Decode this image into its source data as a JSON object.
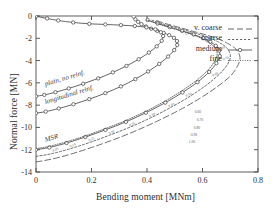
{
  "figure": {
    "background_color": "#ffffff",
    "line_color": "#4a4a4a",
    "text_color": "#2e2e2e"
  },
  "chart_data": {
    "type": "line",
    "title": "",
    "xlabel": "Bending moment [MNm]",
    "ylabel": "Normal force [MN]",
    "xlim": [
      0,
      0.8
    ],
    "ylim": [
      -14,
      0
    ],
    "xticks": [
      "0",
      "0.2",
      "0.4",
      "0.6",
      "0.8"
    ],
    "xtick_values": [
      0,
      0.2,
      0.4,
      0.6,
      0.8
    ],
    "yticks": [
      "-14",
      "-12",
      "-10",
      "-8",
      "-6",
      "-4",
      "-2",
      "0"
    ],
    "ytick_values": [
      -14,
      -12,
      -10,
      -8,
      -6,
      -4,
      -2,
      0
    ],
    "grid": false,
    "legend_position": "top-right",
    "legend": [
      {
        "label": "v. coarse",
        "style": "long-dashed"
      },
      {
        "label": "coarse",
        "style": "dashed"
      },
      {
        "label": "medium",
        "style": "solid-markers"
      },
      {
        "label": "fine",
        "style": "dotted"
      }
    ],
    "annotations": [
      {
        "text": "MSR",
        "x": 0.02,
        "y": -11.3
      },
      {
        "text": "longitudinal reinf.",
        "x": 0.02,
        "y": -7.9
      },
      {
        "text": "plain, no reinf.",
        "x": 0.02,
        "y": -6.3
      }
    ],
    "point_labels_msr": [
      "0.05",
      "0.10",
      "0.15",
      "0.20",
      "0.25",
      "0.30",
      "0.40",
      "0.50",
      "0.60",
      "0.70",
      "0.80",
      "0.90",
      "1.00"
    ],
    "series": [
      {
        "name": "MSR v. coarse",
        "group": "MSR",
        "mesh": "v. coarse",
        "style": "long-dashed",
        "x": [
          0.0,
          0.055,
          0.125,
          0.2,
          0.28,
          0.36,
          0.44,
          0.52,
          0.59,
          0.65,
          0.7,
          0.725,
          0.735,
          0.73,
          0.715,
          0.69,
          0.66,
          0.62,
          0.57,
          0.52,
          0.47,
          0.43
        ],
        "y": [
          -13.1,
          -12.85,
          -12.4,
          -11.8,
          -11.1,
          -10.3,
          -9.4,
          -8.4,
          -7.4,
          -6.4,
          -5.4,
          -4.55,
          -3.85,
          -3.3,
          -2.85,
          -2.45,
          -2.1,
          -1.75,
          -1.4,
          -1.05,
          -0.7,
          -0.38
        ]
      },
      {
        "name": "MSR coarse",
        "group": "MSR",
        "mesh": "coarse",
        "style": "dashed",
        "x": [
          0.0,
          0.052,
          0.118,
          0.19,
          0.265,
          0.342,
          0.418,
          0.492,
          0.558,
          0.614,
          0.66,
          0.688,
          0.7,
          0.697,
          0.684,
          0.662,
          0.634,
          0.598,
          0.552,
          0.504,
          0.456,
          0.418
        ],
        "y": [
          -12.6,
          -12.38,
          -11.95,
          -11.38,
          -10.7,
          -9.94,
          -9.08,
          -8.12,
          -7.16,
          -6.2,
          -5.24,
          -4.42,
          -3.74,
          -3.22,
          -2.78,
          -2.4,
          -2.06,
          -1.72,
          -1.38,
          -1.04,
          -0.7,
          -0.38
        ]
      },
      {
        "name": "MSR medium",
        "group": "MSR",
        "mesh": "medium",
        "style": "solid-markers",
        "x": [
          0.0,
          0.048,
          0.11,
          0.178,
          0.25,
          0.324,
          0.396,
          0.466,
          0.528,
          0.582,
          0.624,
          0.65,
          0.662,
          0.66,
          0.648,
          0.628,
          0.602,
          0.568,
          0.526,
          0.482,
          0.438,
          0.402
        ],
        "y": [
          -12.0,
          -11.8,
          -11.4,
          -10.86,
          -10.22,
          -9.5,
          -8.68,
          -7.78,
          -6.86,
          -5.94,
          -5.02,
          -4.24,
          -3.6,
          -3.1,
          -2.68,
          -2.32,
          -1.99,
          -1.66,
          -1.33,
          -1.0,
          -0.67,
          -0.36
        ]
      },
      {
        "name": "MSR fine",
        "group": "MSR",
        "mesh": "fine",
        "style": "dotted",
        "x": [
          0.0,
          0.047,
          0.108,
          0.175,
          0.246,
          0.319,
          0.39,
          0.459,
          0.52,
          0.573,
          0.615,
          0.64,
          0.652,
          0.65,
          0.638,
          0.619,
          0.593,
          0.56,
          0.519,
          0.476,
          0.433,
          0.398
        ],
        "y": [
          -11.9,
          -11.7,
          -11.3,
          -10.78,
          -10.14,
          -9.43,
          -8.62,
          -7.72,
          -6.8,
          -5.89,
          -4.98,
          -4.21,
          -3.57,
          -3.08,
          -2.66,
          -2.3,
          -1.97,
          -1.65,
          -1.32,
          -0.99,
          -0.66,
          -0.36
        ]
      },
      {
        "name": "longitudinal reinf.",
        "group": "longitudinal reinf.",
        "mesh": "medium",
        "style": "solid-markers",
        "x": [
          0.0,
          0.035,
          0.082,
          0.135,
          0.192,
          0.25,
          0.306,
          0.358,
          0.404,
          0.444,
          0.476,
          0.498,
          0.509,
          0.508,
          0.497,
          0.48,
          0.46,
          0.437,
          0.415,
          0.396,
          0.38,
          0.368,
          0.358,
          0.352
        ],
        "y": [
          -8.72,
          -8.58,
          -8.3,
          -7.92,
          -7.46,
          -6.92,
          -6.32,
          -5.66,
          -4.98,
          -4.3,
          -3.64,
          -3.06,
          -2.6,
          -2.25,
          -1.96,
          -1.72,
          -1.52,
          -1.33,
          -1.14,
          -0.94,
          -0.73,
          -0.52,
          -0.3,
          -0.06
        ]
      },
      {
        "name": "plain, no reinf.",
        "group": "plain, no reinf.",
        "mesh": "medium",
        "style": "solid-markers",
        "x": [
          0.0,
          0.03,
          0.07,
          0.118,
          0.17,
          0.224,
          0.277,
          0.326,
          0.37,
          0.407,
          0.435,
          0.453,
          0.458,
          0.45,
          0.43,
          0.398,
          0.356,
          0.306,
          0.25,
          0.192,
          0.134,
          0.08,
          0.04,
          0.0
        ],
        "y": [
          -7.2,
          -7.08,
          -6.84,
          -6.5,
          -6.08,
          -5.6,
          -5.06,
          -4.48,
          -3.88,
          -3.28,
          -2.72,
          -2.22,
          -1.8,
          -1.46,
          -1.2,
          -1.02,
          -0.9,
          -0.82,
          -0.76,
          -0.7,
          -0.58,
          -0.4,
          -0.22,
          -0.02
        ]
      }
    ]
  }
}
